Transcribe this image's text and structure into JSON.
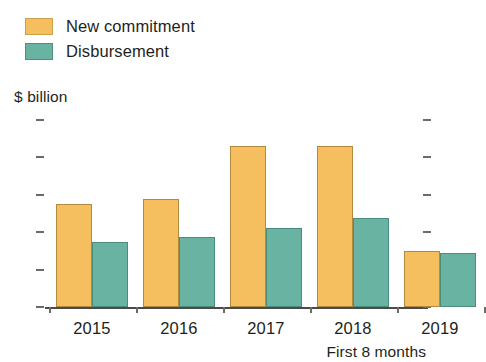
{
  "legend": {
    "items": [
      {
        "label": "New commitment",
        "color": "#F5BE5E",
        "key": "new_commitment"
      },
      {
        "label": "Disbursement",
        "color": "#69B3A2",
        "key": "disbursement"
      }
    ]
  },
  "axis": {
    "y_title": "$ billion",
    "y_ticks": [
      "0",
      "8",
      "16",
      "24",
      "32",
      "40"
    ],
    "x_ticks": [
      "2015",
      "2016",
      "2017",
      "2018",
      "2019"
    ]
  },
  "footnote": "First 8 months",
  "chart_data": {
    "type": "bar",
    "title": "",
    "subtitle": "",
    "xlabel": "",
    "ylabel": "$ billion",
    "ylim": [
      0,
      40
    ],
    "ytick_values": [
      0,
      8,
      16,
      24,
      32,
      40
    ],
    "grid": false,
    "legend_position": "top-left",
    "categories": [
      "2015",
      "2016",
      "2017",
      "2018",
      "2019"
    ],
    "series": [
      {
        "name": "New commitment",
        "color": "#F5BE5E",
        "values": [
          22,
          23,
          34.5,
          34.5,
          12
        ]
      },
      {
        "name": "Disbursement",
        "color": "#69B3A2",
        "values": [
          14,
          15,
          17,
          19,
          11.5
        ]
      }
    ],
    "annotations": [
      {
        "text": "First 8 months",
        "target_category": "2019",
        "position": "below-axis-right"
      }
    ]
  }
}
